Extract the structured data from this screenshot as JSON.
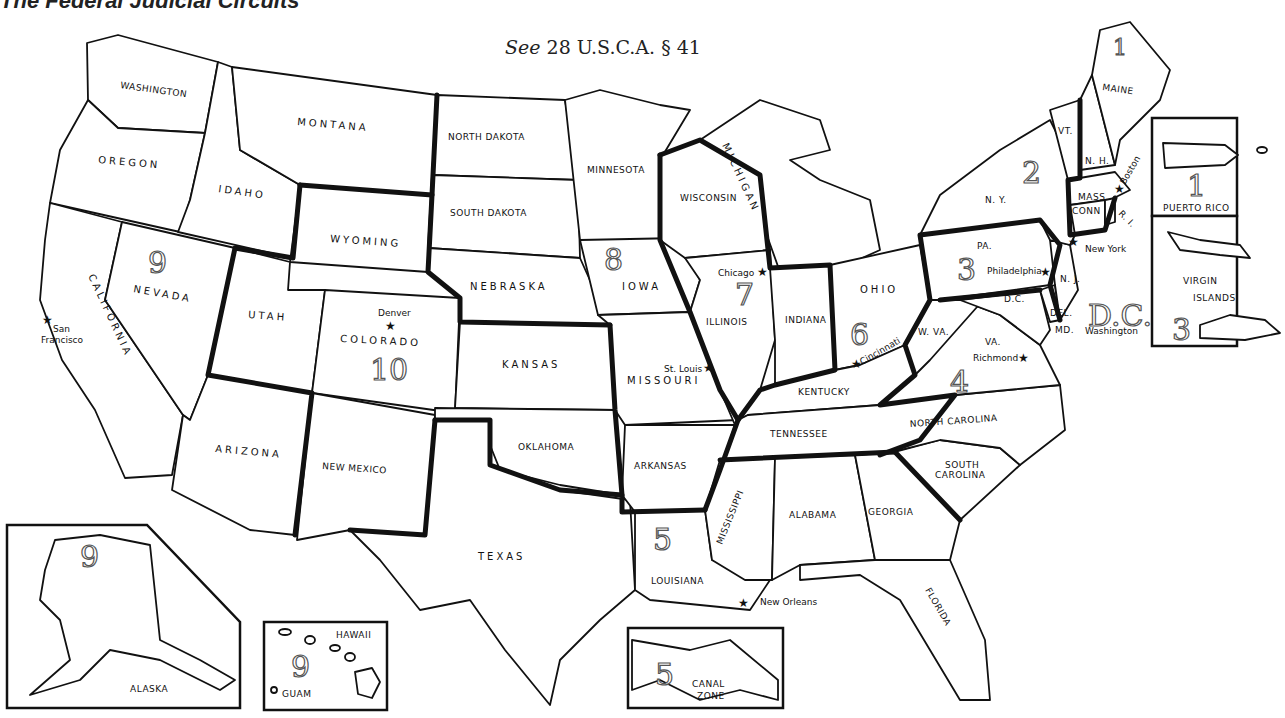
{
  "title": "The Federal Judicial Circuits",
  "citation": {
    "prefix": "See",
    "text": "28 U.S.C.A. § 41"
  },
  "states": {
    "washington": "WASHINGTON",
    "oregon": "OREGON",
    "california": "CALIFORNIA",
    "nevada": "NEVADA",
    "idaho": "IDAHO",
    "montana": "MONTANA",
    "wyoming": "WYOMING",
    "utah": "UTAH",
    "colorado": "COLORADO",
    "arizona": "ARIZONA",
    "new_mexico": "NEW MEXICO",
    "north_dakota": "NORTH DAKOTA",
    "south_dakota": "SOUTH DAKOTA",
    "nebraska": "NEBRASKA",
    "kansas": "KANSAS",
    "oklahoma": "OKLAHOMA",
    "texas": "TEXAS",
    "minnesota": "MINNESOTA",
    "iowa": "IOWA",
    "missouri": "MISSOURI",
    "arkansas": "ARKANSAS",
    "louisiana": "LOUISIANA",
    "wisconsin": "WISCONSIN",
    "illinois": "ILLINOIS",
    "indiana": "INDIANA",
    "michigan": "MICHIGAN",
    "ohio": "OHIO",
    "kentucky": "KENTUCKY",
    "tennessee": "TENNESSEE",
    "mississippi": "MISSISSIPPI",
    "alabama": "ALABAMA",
    "georgia": "GEORGIA",
    "florida": "FLORIDA",
    "south_carolina_1": "SOUTH",
    "south_carolina_2": "CAROLINA",
    "north_carolina": "NORTH CAROLINA",
    "virginia": "VA.",
    "west_virginia": "W. VA.",
    "maryland": "MD.",
    "delaware": "DEL.",
    "dc": "D.C.",
    "pennsylvania": "PA.",
    "new_jersey": "N. J.",
    "new_york": "N. Y.",
    "connecticut": "CONN",
    "rhode_island": "R. I.",
    "massachusetts": "MASS.",
    "vermont": "VT.",
    "new_hampshire": "N. H.",
    "maine": "MAINE"
  },
  "cities": {
    "san_francisco_1": "San",
    "san_francisco_2": "Francisco",
    "denver": "Denver",
    "st_louis": "St. Louis",
    "chicago": "Chicago",
    "cincinnati": "Cincinnati",
    "new_orleans": "New Orleans",
    "richmond": "Richmond",
    "philadelphia": "Philadelphia",
    "new_york": "New York",
    "boston": "Boston",
    "washington": "Washington"
  },
  "circuits": {
    "c1": "1",
    "c2": "2",
    "c3": "3",
    "c4": "4",
    "c5": "5",
    "c6": "6",
    "c7": "7",
    "c8": "8",
    "c9": "9",
    "c10": "10",
    "dc": "D.C.",
    "c1_maine": "1",
    "c3_vi": "3",
    "c5_cz": "5",
    "c9_ak": "9",
    "c9_hi": "9"
  },
  "insets": {
    "puerto_rico": "PUERTO RICO",
    "virgin_islands_1": "VIRGIN",
    "virgin_islands_2": "ISLANDS",
    "alaska": "ALASKA",
    "hawaii": "HAWAII",
    "guam": "GUAM",
    "canal_zone_1": "CANAL",
    "canal_zone_2": "ZONE"
  }
}
